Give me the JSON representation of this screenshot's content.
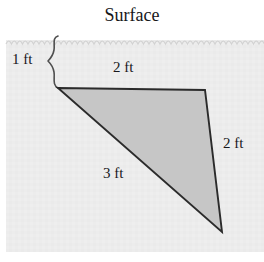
{
  "figure": {
    "title": "Surface",
    "background_color": "#ececec",
    "above_surface_color": "#ffffff",
    "shape": {
      "name": "triangle",
      "fill_color": "#c4c4c4",
      "stroke_color": "#2b2b2b",
      "vertices": [
        {
          "x": 58,
          "y": 88
        },
        {
          "x": 205,
          "y": 90
        },
        {
          "x": 222,
          "y": 232
        }
      ]
    },
    "surface_line": {
      "name": "scalloped-surface-edge",
      "y": 38,
      "scallop_period": 11,
      "color": "#d0d0d0"
    },
    "brace": {
      "name": "depth-brace",
      "from_y": 36,
      "to_y": 88,
      "color": "#4a4a4a"
    },
    "labels": {
      "depth": "1 ft",
      "top_side": "2 ft",
      "right_side": "2 ft",
      "hypotenuse": "3 ft"
    }
  }
}
